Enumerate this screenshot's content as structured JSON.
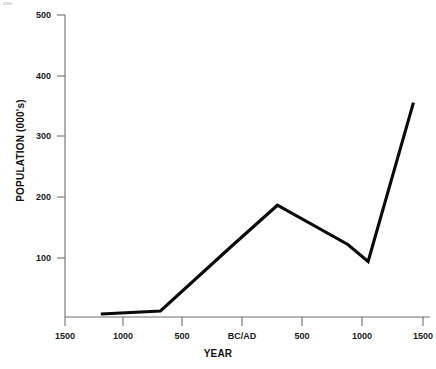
{
  "chart_data": {
    "type": "line",
    "title": "",
    "subtitle": "",
    "xlabel": "YEAR",
    "ylabel": "POPULATION (000's)",
    "xlim": [
      -1500,
      1500
    ],
    "ylim": [
      0,
      500
    ],
    "grid": false,
    "legend": null,
    "legend_position": "none",
    "line_color": "#0a0a0a",
    "axis_color": "#6d6d6d",
    "x_tick_values": [
      -1500,
      -1000,
      -500,
      0,
      500,
      1000,
      1500
    ],
    "x_tick_labels": [
      "1500",
      "1000",
      "500",
      "BC/AD",
      "500",
      "1000",
      "1500"
    ],
    "y_tick_values": [
      100,
      200,
      300,
      400,
      500
    ],
    "y_tick_labels": [
      "100",
      "200",
      "300",
      "400",
      "500"
    ],
    "series": [
      {
        "name": "Population",
        "x": [
          -1200,
          -700,
          -100,
          280,
          870,
          1040,
          1420
        ],
        "values": [
          5,
          10,
          118,
          185,
          120,
          92,
          355
        ]
      }
    ]
  },
  "axes": {
    "x_title": "YEAR",
    "y_title": "POPULATION (000's)"
  },
  "ticks": {
    "y": [
      "500",
      "400",
      "300",
      "200",
      "100"
    ],
    "x": [
      "1500",
      "1000",
      "500",
      "BC/AD",
      "500",
      "1000",
      "1500"
    ]
  }
}
